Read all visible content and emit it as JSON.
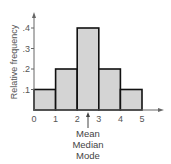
{
  "chart_data": {
    "type": "bar",
    "subtype": "histogram",
    "title": "",
    "xlabel": "",
    "ylabel": "Relative frequency",
    "bins": [
      [
        0,
        1
      ],
      [
        1,
        2
      ],
      [
        2,
        3
      ],
      [
        3,
        4
      ],
      [
        4,
        5
      ]
    ],
    "categories": [
      "0-1",
      "1-2",
      "2-3",
      "3-4",
      "4-5"
    ],
    "values": [
      0.1,
      0.2,
      0.4,
      0.2,
      0.1
    ],
    "x_ticks": [
      "0",
      "1",
      "2",
      "3",
      "4",
      "5"
    ],
    "y_ticks": [
      ".1",
      ".2",
      ".3",
      ".4"
    ],
    "xlim": [
      0,
      5
    ],
    "ylim": [
      0,
      0.4
    ],
    "grid": false,
    "legend": null,
    "annotations": [
      {
        "type": "arrow",
        "x": 2.5,
        "label_lines": [
          "Mean",
          "Median",
          "Mode"
        ]
      }
    ]
  },
  "style": {
    "bar_fill": "#d4d4d4",
    "bar_stroke": "#111111",
    "axis_color": "#666666"
  }
}
